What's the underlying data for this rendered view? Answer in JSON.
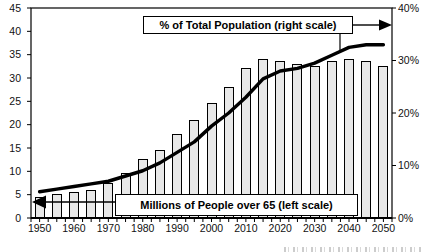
{
  "chart_data": {
    "type": "combo",
    "categories": [
      1950,
      1955,
      1960,
      1965,
      1970,
      1975,
      1980,
      1985,
      1990,
      1995,
      2000,
      2005,
      2010,
      2015,
      2020,
      2025,
      2030,
      2035,
      2040,
      2045,
      2050
    ],
    "series": [
      {
        "name": "Millions of People over 65 (left scale)",
        "type": "bar",
        "axis": "left",
        "values": [
          4.5,
          5,
          5.5,
          6,
          7.5,
          9.5,
          12.5,
          14.5,
          18,
          21,
          24.5,
          28,
          32,
          34,
          33.5,
          33,
          32.5,
          33.5,
          34,
          33.5,
          32.5
        ]
      },
      {
        "name": "% of Total Population (right scale)",
        "type": "line",
        "axis": "right",
        "values": [
          5,
          5.5,
          6,
          6.5,
          7,
          8,
          9,
          10.5,
          12.5,
          14.5,
          17.5,
          20,
          23,
          26.5,
          28,
          28.5,
          29.5,
          31,
          32.5,
          33,
          33
        ]
      }
    ],
    "left_axis": {
      "min": 0,
      "max": 45,
      "step": 5,
      "tick_labels": [
        "0",
        "5",
        "10",
        "15",
        "20",
        "25",
        "30",
        "35",
        "40",
        "45"
      ]
    },
    "right_axis": {
      "min": 0,
      "max": 40,
      "step": 10,
      "tick_labels": [
        "0%",
        "10%",
        "20%",
        "30%",
        "40%"
      ]
    },
    "x_tick_labels": [
      "1950",
      "1960",
      "1970",
      "1980",
      "1990",
      "2000",
      "2010",
      "2020",
      "2030",
      "2040",
      "2050"
    ],
    "grid": false,
    "legend": "callout-boxes",
    "annotations": {
      "line_callout": {
        "label": "% of Total Population (right scale)",
        "arrow_direction": "right"
      },
      "bar_callout": {
        "label": "Millions of People over 65 (left scale)",
        "arrow_direction": "left"
      }
    }
  },
  "colors": {
    "background": "#ffffff",
    "bar_fill": "#e8e8e8",
    "bar_outline": "#000000",
    "line": "#000000",
    "frame": "#000000",
    "text": "#111111"
  }
}
